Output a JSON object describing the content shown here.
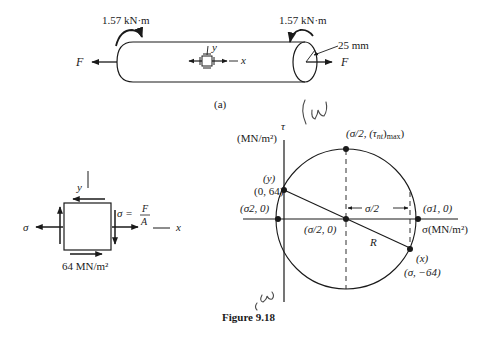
{
  "figure": {
    "caption": "Figure 9.18",
    "part_a_label": "(a)"
  },
  "shaft": {
    "torque_left": "1.57 kN·m",
    "torque_right": "1.57 kN·m",
    "radius_label": "25 mm",
    "force_left": "F",
    "force_right": "F",
    "element_y_label": "y",
    "element_x_label": "x"
  },
  "stress_element": {
    "y_axis_label": "y",
    "x_axis_label": "x",
    "sigma_left": "σ",
    "sigma_eq": "σ = ",
    "sigma_num": "F",
    "sigma_den": "A",
    "shear_label": "64 MN/m²"
  },
  "mohr_circle": {
    "tau_axis_label": "τ",
    "tau_axis_units": "(MN/m²)",
    "sigma_axis_label": "σ(MN/m²)",
    "top_point": "(σ/2, (τnt)max)",
    "top_point_prefix": "(σ/2, (τ",
    "top_point_sub": "nt",
    "top_point_suffix": ")",
    "top_point_sub2": "max",
    "top_point_end": ")",
    "y_point_name": "(y)",
    "y_point_coords": "(0, 64)",
    "sigma2_label": "(σ2, 0)",
    "sigma1_label": "(σ1, 0)",
    "center_label": "(σ/2, 0)",
    "half_sigma_dim": "σ/2",
    "radius_label": "R",
    "x_point_name": "(x)",
    "x_point_coords": "(σ, −64)",
    "handwritten_top": "CW",
    "handwritten_bottom": "CW"
  }
}
